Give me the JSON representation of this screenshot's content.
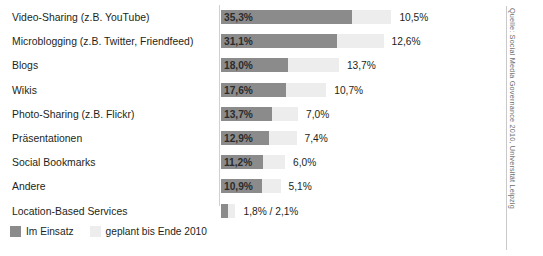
{
  "chart_data": {
    "type": "bar",
    "orientation": "horizontal",
    "stacked": true,
    "title": "",
    "xlabel": "",
    "ylabel": "",
    "xlim": [
      0,
      75
    ],
    "grid": false,
    "legend_position": "bottom-left",
    "categories": [
      "Video-Sharing (z.B. YouTube)",
      "Microblogging (z.B. Twitter, Friendfeed)",
      "Blogs",
      "Wikis",
      "Photo-Sharing (z.B. Flickr)",
      "Präsentationen",
      "Social Bookmarks",
      "Andere",
      "Location-Based Services"
    ],
    "series": [
      {
        "name": "Im Einsatz",
        "color": "#8b8b8b",
        "values": [
          35.3,
          31.1,
          18.0,
          17.6,
          13.7,
          12.9,
          11.2,
          10.9,
          1.8
        ],
        "labels": [
          "35,3%",
          "31,1%",
          "18,0%",
          "17,6%",
          "13,7%",
          "12,9%",
          "11,2%",
          "10,9%",
          "1,8%"
        ]
      },
      {
        "name": "geplant bis Ende 2010",
        "color": "#ededed",
        "values": [
          10.5,
          12.6,
          13.7,
          10.7,
          7.0,
          7.4,
          6.0,
          5.1,
          2.1
        ],
        "labels": [
          "10,5%",
          "12,6%",
          "13,7%",
          "10,7%",
          "7,0%",
          "7,4%",
          "6,0%",
          "5,1%",
          "2,1%"
        ]
      }
    ],
    "combined_label_last_row": "1,8% / 2,1%"
  },
  "rows": [
    {
      "label": "Video-Sharing (z.B. YouTube)",
      "used": 35.3,
      "plan": 10.5,
      "used_label": "35,3%",
      "plan_label": "10,5%",
      "inside": true
    },
    {
      "label": "Microblogging (z.B. Twitter, Friendfeed)",
      "used": 31.1,
      "plan": 12.6,
      "used_label": "31,1%",
      "plan_label": "12,6%",
      "inside": true
    },
    {
      "label": "Blogs",
      "used": 18.0,
      "plan": 13.7,
      "used_label": "18,0%",
      "plan_label": "13,7%",
      "inside": true
    },
    {
      "label": "Wikis",
      "used": 17.6,
      "plan": 10.7,
      "used_label": "17,6%",
      "plan_label": "10,7%",
      "inside": true
    },
    {
      "label": "Photo-Sharing (z.B. Flickr)",
      "used": 13.7,
      "plan": 7.0,
      "used_label": "13,7%",
      "plan_label": "7,0%",
      "inside": true
    },
    {
      "label": "Präsentationen",
      "used": 12.9,
      "plan": 7.4,
      "used_label": "12,9%",
      "plan_label": "7,4%",
      "inside": true
    },
    {
      "label": "Social Bookmarks",
      "used": 11.2,
      "plan": 6.0,
      "used_label": "11,2%",
      "plan_label": "6,0%",
      "inside": true
    },
    {
      "label": "Andere",
      "used": 10.9,
      "plan": 5.1,
      "used_label": "10,9%",
      "plan_label": "5,1%",
      "inside": true
    },
    {
      "label": "Location-Based Services",
      "used": 1.8,
      "plan": 2.1,
      "used_label": "",
      "plan_label": "1,8% / 2,1%",
      "inside": false
    }
  ],
  "legend": {
    "used_label": "Im Einsatz",
    "plan_label": "geplant bis Ende 2010"
  },
  "source": {
    "text": "Quelle: Social Media Governance 2010, Universität Leipzig"
  },
  "colors": {
    "used": "#8b8b8b",
    "plan": "#ededed",
    "text": "#231f20",
    "rule": "#c9c9c9",
    "background": "#ffffff"
  }
}
